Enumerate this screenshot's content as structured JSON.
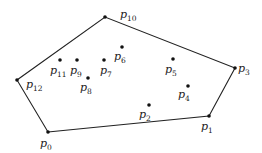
{
  "diagram": {
    "type": "convex-hull",
    "colors": {
      "background": "#ffffff",
      "stroke": "#222222",
      "point": "#111111"
    },
    "points": [
      {
        "id": "p0",
        "base": "p",
        "sub": "0",
        "x": 48,
        "y": 132,
        "lx": 40,
        "ly": 147,
        "on_hull": true
      },
      {
        "id": "p1",
        "base": "p",
        "sub": "1",
        "x": 209,
        "y": 116,
        "lx": 201,
        "ly": 130,
        "on_hull": true
      },
      {
        "id": "p2",
        "base": "p",
        "sub": "2",
        "x": 149,
        "y": 105,
        "lx": 139,
        "ly": 118,
        "on_hull": false
      },
      {
        "id": "p3",
        "base": "p",
        "sub": "3",
        "x": 235,
        "y": 68,
        "lx": 238,
        "ly": 72,
        "on_hull": true
      },
      {
        "id": "p4",
        "base": "p",
        "sub": "4",
        "x": 188,
        "y": 86,
        "lx": 178,
        "ly": 98,
        "on_hull": false
      },
      {
        "id": "p5",
        "base": "p",
        "sub": "5",
        "x": 173,
        "y": 59,
        "lx": 165,
        "ly": 73,
        "on_hull": false
      },
      {
        "id": "p6",
        "base": "p",
        "sub": "6",
        "x": 122,
        "y": 47,
        "lx": 114,
        "ly": 60,
        "on_hull": false
      },
      {
        "id": "p7",
        "base": "p",
        "sub": "7",
        "x": 104,
        "y": 60,
        "lx": 100,
        "ly": 74,
        "on_hull": false
      },
      {
        "id": "p8",
        "base": "p",
        "sub": "8",
        "x": 88,
        "y": 78,
        "lx": 80,
        "ly": 91,
        "on_hull": false
      },
      {
        "id": "p9",
        "base": "p",
        "sub": "9",
        "x": 77,
        "y": 60,
        "lx": 70,
        "ly": 74,
        "on_hull": false
      },
      {
        "id": "p10",
        "base": "p",
        "sub": "10",
        "x": 105,
        "y": 17,
        "lx": 120,
        "ly": 18,
        "on_hull": true
      },
      {
        "id": "p11",
        "base": "p",
        "sub": "11",
        "x": 60,
        "y": 60,
        "lx": 50,
        "ly": 74,
        "on_hull": false
      },
      {
        "id": "p12",
        "base": "p",
        "sub": "12",
        "x": 17,
        "y": 80,
        "lx": 26,
        "ly": 88,
        "on_hull": true
      }
    ],
    "hull_order": [
      "p0",
      "p1",
      "p3",
      "p10",
      "p12"
    ]
  }
}
